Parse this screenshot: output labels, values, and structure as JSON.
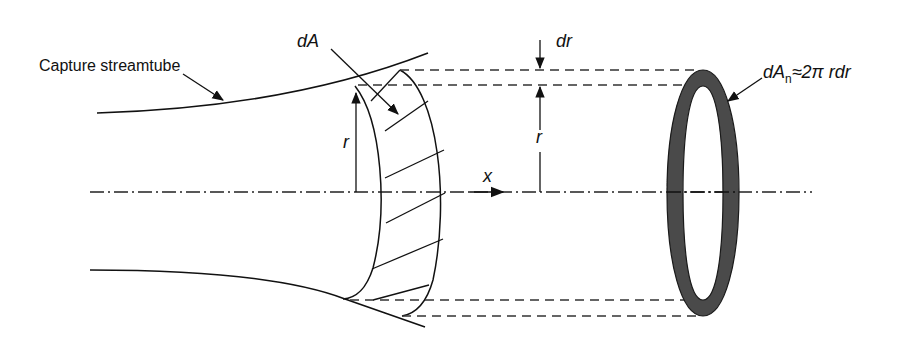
{
  "diagram": {
    "labels": {
      "capture_streamtube": "Capture streamtube",
      "dA": "dA",
      "dr": "dr",
      "r_left": "r",
      "r_right": "r",
      "x_axis": "x",
      "dAn_prefix": "dA",
      "dAn_sub": "n",
      "dAn_suffix": "≈2π rdr"
    },
    "colors": {
      "line": "#111111",
      "dashed": "#333333",
      "ring_fill": "#4a4a4a",
      "background": "#ffffff"
    }
  }
}
